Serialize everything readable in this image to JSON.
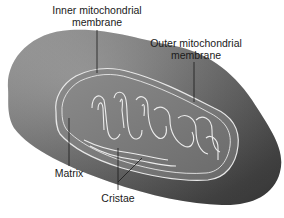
{
  "diagram": {
    "labels": {
      "inner_membrane": {
        "line1": "Inner mitochondrial",
        "line2": "membrane"
      },
      "outer_membrane": {
        "line1": "Outer mitochondrial",
        "line2": "membrane"
      },
      "matrix": "Matrix",
      "cristae": "Cristae"
    },
    "colors": {
      "background": "#ffffff",
      "outer_body_light": "#8a8a8a",
      "outer_body_dark": "#4a4a4a",
      "inner_body": "#7c7c7c",
      "membrane_line": "#e8e8e8",
      "label_text": "#1a1a1a",
      "leader_line": "#1a1a1a"
    }
  }
}
